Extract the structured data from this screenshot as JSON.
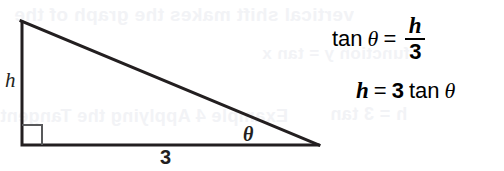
{
  "figure": {
    "name": "right-triangle-tangent-figure",
    "background_color": "#ffffff",
    "ink_color": "#231f20",
    "bleed_color": "#f2f3f6"
  },
  "triangle": {
    "labels": {
      "opposite_side": "h",
      "adjacent_side": "3",
      "angle": "θ"
    },
    "right_angle_marker": "right-angle-square",
    "vertices": {
      "apex": [
        22,
        22
      ],
      "right_angle": [
        22,
        145
      ],
      "angle_vertex": [
        318,
        145
      ]
    },
    "stroke_color": "#231f20",
    "stroke_width": 3
  },
  "equations": [
    {
      "id": "tan-theta-equation",
      "function": "tan",
      "angle": "θ",
      "operator": "=",
      "fraction": {
        "numerator": "h",
        "denominator": "3"
      }
    },
    {
      "id": "h-solved-equation",
      "variable": "h",
      "operator": "=",
      "coefficient": "3",
      "function": "tan",
      "angle": "θ"
    }
  ],
  "bleed_through_text": {
    "line1": "vertical shift makes the graph of the",
    "line2": "function y = tan x",
    "line3": "Example 4  Applying the Tangent",
    "line4": "h = 3 tan"
  }
}
